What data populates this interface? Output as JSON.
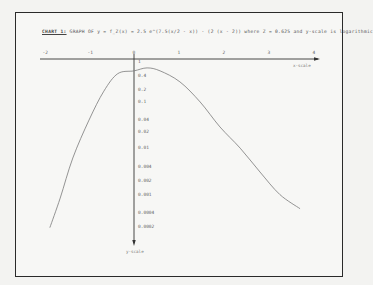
{
  "chart_data": {
    "type": "line",
    "title": "CHART 1: GRAPH OF y = f_Z(x) = 2.5 e^(7.5(x/2 - x)) · (2 (x - 2)) where Z = 0.625 and y-scale is logarithmic",
    "title_lead": "CHART 1:",
    "title_rest": "GRAPH OF  y = f_Z(x) = 2.5 e^(7.5(x/2 - x)) · (2 (x - 2))   where Z = 0.625  and y-scale is logarithmic",
    "xlabel": "x-scale",
    "ylabel": "y-scale",
    "xlim": [
      -2,
      4
    ],
    "ylim": [
      0.0002,
      1
    ],
    "yscale": "log",
    "grid": false,
    "x_ticks": [
      "-2",
      "-1",
      "0",
      "1",
      "2",
      "3",
      "4"
    ],
    "y_ticks": [
      "1",
      "0.4",
      "0.2",
      "0.1",
      "0.04",
      "0.02",
      "0.01",
      "0.004",
      "0.002",
      "0.001",
      "0.0004",
      "0.0002"
    ],
    "series": [
      {
        "name": "f_Z(x)",
        "x": [
          -1.87,
          -1.64,
          -1.36,
          -1.0,
          -0.67,
          -0.36,
          0.0,
          0.29,
          0.58,
          1.02,
          1.47,
          1.91,
          2.36,
          2.8,
          3.24,
          3.69
        ],
        "y": [
          0.00018,
          0.00083,
          0.0066,
          0.047,
          0.21,
          0.52,
          0.6,
          0.7,
          0.6,
          0.34,
          0.12,
          0.033,
          0.011,
          0.0032,
          0.001,
          0.00048
        ]
      }
    ]
  }
}
